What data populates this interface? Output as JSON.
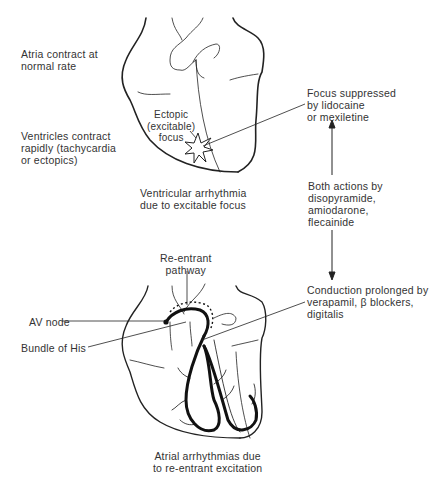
{
  "top_panel": {
    "title": "Ventricular arrhythmia\ndue to excitable focus",
    "left_labels": {
      "atria": "Atria contract at\nnormal rate",
      "ventricles": "Ventricles contract\nrapidly (tachycardia\nor ectopics)"
    },
    "focus_label": "Ectopic\n(excitable)\nfocus",
    "right_label": "Focus suppressed\nby lidocaine\nor mexiletine"
  },
  "middle": {
    "both_actions_label": "Both actions by\ndisopyramide,\namiodarone,\nflecainide"
  },
  "bottom_panel": {
    "title": "Atrial arrhythmias due\nto re-entrant excitation",
    "reentrant_label": "Re-entrant\npathway",
    "av_node_label": "AV node",
    "bundle_label": "Bundle of His",
    "right_label": "Conduction prolonged by\nverapamil, β blockers,\ndigitalis"
  },
  "colors": {
    "line": "#222222",
    "text": "#333333",
    "background": "#ffffff"
  }
}
